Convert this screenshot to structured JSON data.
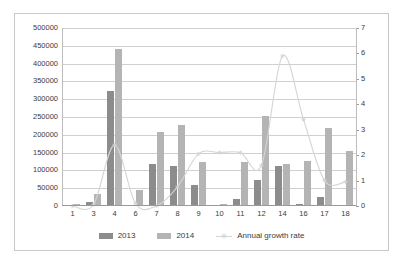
{
  "chart_data": {
    "type": "bar",
    "title": "",
    "subtitle": "",
    "xlabel": "",
    "ylabel": "",
    "y2label": "",
    "grid": true,
    "legend_position": "bottom",
    "categories": [
      "1",
      "3",
      "4",
      "6",
      "7",
      "8",
      "9",
      "10",
      "11",
      "12",
      "14",
      "16",
      "17",
      "18"
    ],
    "ylim": [
      0,
      500000
    ],
    "yticks": [
      "0",
      "50000",
      "100000",
      "150000",
      "200000",
      "250000",
      "300000",
      "350000",
      "400000",
      "450000",
      "500000"
    ],
    "y2lim": [
      0,
      7
    ],
    "y2ticks": [
      "0",
      "1",
      "2",
      "3",
      "4",
      "5",
      "6",
      "7"
    ],
    "series": [
      {
        "name": "2013",
        "axis": "left",
        "kind": "bar",
        "color": "#8c8c8c",
        "values": [
          0,
          10000,
          322000,
          0,
          117000,
          112000,
          59000,
          2000,
          21000,
          74000,
          111000,
          5000,
          25000,
          0
        ]
      },
      {
        "name": "2014",
        "axis": "left",
        "kind": "bar",
        "color": "#b4b4b4",
        "values": [
          7000,
          35000,
          441000,
          46000,
          209000,
          228000,
          125000,
          6000,
          123000,
          253000,
          117000,
          127000,
          220000,
          155000
        ]
      },
      {
        "name": "Annual growth rate",
        "axis": "right",
        "kind": "line",
        "color": "#d5d5d5",
        "values": [
          0.0,
          0.05,
          2.4,
          0.1,
          0.0,
          0.75,
          2.05,
          2.1,
          2.1,
          1.6,
          5.9,
          3.4,
          1.0,
          0.95
        ]
      }
    ]
  },
  "legend": {
    "items": [
      {
        "label": "2013",
        "marker": "square-dark"
      },
      {
        "label": "2014",
        "marker": "square-light"
      },
      {
        "label": "Annual growth rate",
        "marker": "line-marker"
      }
    ]
  },
  "colors": {
    "series_2013": "#8c8c8c",
    "series_2014": "#b4b4b4",
    "line": "#d5d5d5",
    "grid": "#d0d0d0",
    "axis": "#9a9a9a",
    "text": "#3b3b3b",
    "frame": "#c9c9c9",
    "background": "#ffffff"
  }
}
